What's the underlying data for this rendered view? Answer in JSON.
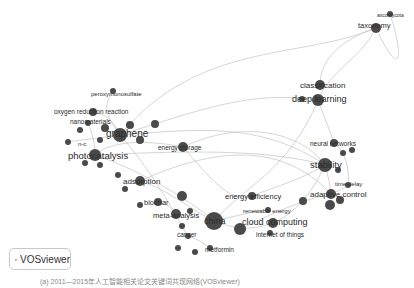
{
  "diagram": {
    "type": "keyword co-occurrence network",
    "node_color": "#4a4a4a",
    "edge_color": "#b5b5b5",
    "nodes": [
      {
        "id": "peroxymonosulfate",
        "label": "peroxymonosulfate",
        "x": 113,
        "y": 91,
        "r": 3
      },
      {
        "id": "oxygen-reduction-reaction",
        "label": "oxygen reduction reaction",
        "x": 93,
        "y": 112,
        "r": 4
      },
      {
        "id": "nanomaterials",
        "label": "nanomaterials",
        "x": 88,
        "y": 123,
        "r": 3
      },
      {
        "id": "graphene",
        "label": "graphene",
        "x": 120,
        "y": 135,
        "r": 7
      },
      {
        "id": "nc",
        "label": "n-c",
        "x": 68,
        "y": 142,
        "r": 3
      },
      {
        "id": "photocatalysis",
        "label": "photocatalysis",
        "x": 95,
        "y": 155,
        "r": 6
      },
      {
        "id": "energy-storage",
        "label": "energy storage",
        "x": 183,
        "y": 147,
        "r": 5
      },
      {
        "id": "adsorption",
        "label": "adsorption",
        "x": 140,
        "y": 181,
        "r": 5
      },
      {
        "id": "biochar",
        "label": "biochar",
        "x": 158,
        "y": 202,
        "r": 4
      },
      {
        "id": "meta-analysis",
        "label": "meta-analysis",
        "x": 176,
        "y": 214,
        "r": 5
      },
      {
        "id": "china",
        "label": "china",
        "x": 214,
        "y": 221,
        "r": 9
      },
      {
        "id": "cancer",
        "label": "cancer",
        "x": 188,
        "y": 236,
        "r": 3
      },
      {
        "id": "metformin",
        "label": "metformin",
        "x": 210,
        "y": 248,
        "r": 3
      },
      {
        "id": "energy-efficiency",
        "label": "energy efficiency",
        "x": 252,
        "y": 196,
        "r": 4
      },
      {
        "id": "renewable-energy",
        "label": "renewable energy",
        "x": 268,
        "y": 210,
        "r": 3
      },
      {
        "id": "cloud-computing",
        "label": "cloud computing",
        "x": 240,
        "y": 229,
        "r": 6
      },
      {
        "id": "internet-of-things",
        "label": "internet of things",
        "x": 270,
        "y": 233,
        "r": 3
      },
      {
        "id": "stability",
        "label": "stability",
        "x": 325,
        "y": 165,
        "r": 7
      },
      {
        "id": "neural-networks",
        "label": "neural networks",
        "x": 334,
        "y": 143,
        "r": 4
      },
      {
        "id": "time-delay",
        "label": "time delay",
        "x": 348,
        "y": 185,
        "r": 3
      },
      {
        "id": "adaptive-control",
        "label": "adaptive control",
        "x": 331,
        "y": 194,
        "r": 5
      },
      {
        "id": "classification",
        "label": "classification",
        "x": 320,
        "y": 85,
        "r": 5
      },
      {
        "id": "deep-learning",
        "label": "deep learning",
        "x": 318,
        "y": 100,
        "r": 6
      },
      {
        "id": "taxonomy",
        "label": "taxonomy",
        "x": 376,
        "y": 28,
        "r": 5
      },
      {
        "id": "ascomycota",
        "label": "ascomycota",
        "x": 390,
        "y": 14,
        "r": 3
      }
    ]
  },
  "badge": {
    "label": "VOSviewer"
  },
  "caption": "(a) 2011—2015年人工智能相关论文关键词共现网络(VOSviewer)"
}
